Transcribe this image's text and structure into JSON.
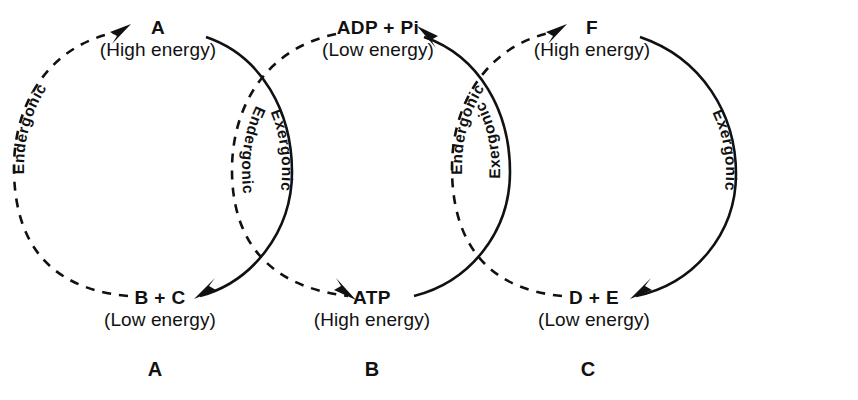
{
  "figure": {
    "background_color": "#ffffff",
    "ink_color": "#111111",
    "width": 858,
    "height": 400
  },
  "panels": [
    {
      "caption": "A",
      "caption_x": 155,
      "center_x": 155,
      "top_node": {
        "name": "A",
        "energy": "(High energy)",
        "x": 158,
        "y": 18
      },
      "bottom_node": {
        "name": "B + C",
        "energy": "(Low energy)",
        "x": 160,
        "y": 288
      },
      "left_arc": {
        "label": "Endergonic",
        "style": "dashed",
        "direction": "upward",
        "arrow_at": "top"
      },
      "right_arc": {
        "label": "Exergonic",
        "style": "solid",
        "direction": "downward",
        "arrow_at": "bottom"
      }
    },
    {
      "caption": "B",
      "caption_x": 372,
      "center_x": 372,
      "top_node": {
        "name": "ADP + Pi",
        "energy": "(Low energy)",
        "x": 378,
        "y": 18
      },
      "bottom_node": {
        "name": "ATP",
        "energy": "(High energy)",
        "x": 372,
        "y": 288
      },
      "left_arc": {
        "label": "Endergonic",
        "style": "dashed",
        "direction": "downward",
        "arrow_at": "bottom"
      },
      "right_arc": {
        "label": "Exergonic",
        "style": "solid",
        "direction": "upward",
        "arrow_at": "top"
      }
    },
    {
      "caption": "C",
      "caption_x": 588,
      "center_x": 588,
      "top_node": {
        "name": "F",
        "energy": "(High energy)",
        "x": 592,
        "y": 18
      },
      "bottom_node": {
        "name": "D + E",
        "energy": "(Low energy)",
        "x": 594,
        "y": 288
      },
      "left_arc": {
        "label": "Endergonic",
        "style": "dashed",
        "direction": "upward",
        "arrow_at": "top"
      },
      "right_arc": {
        "label": "Exergonic",
        "style": "solid",
        "direction": "downward",
        "arrow_at": "bottom"
      }
    }
  ],
  "caption_row_y": 358
}
